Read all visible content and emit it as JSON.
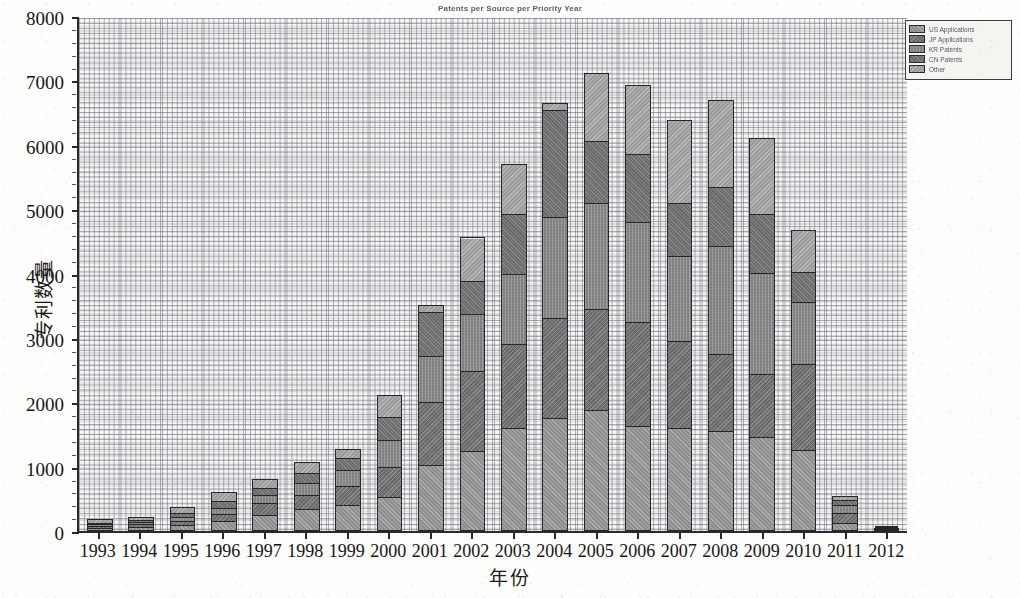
{
  "chart_data": {
    "type": "bar",
    "title": "Patents per Source per Priority Year",
    "xlabel": "年份",
    "ylabel": "专利数量",
    "ylim": [
      0,
      8000
    ],
    "ytick_step": 1000,
    "yticks": [
      "0",
      "1000",
      "2000",
      "3000",
      "4000",
      "5000",
      "6000",
      "7000",
      "8000"
    ],
    "grid": true,
    "grid_style": "dashed",
    "minor_ticks": true,
    "stacked": true,
    "legend_position": "top-right",
    "categories": [
      "1993",
      "1994",
      "1995",
      "1996",
      "1997",
      "1998",
      "1999",
      "2000",
      "2001",
      "2002",
      "2003",
      "2004",
      "2005",
      "2006",
      "2007",
      "2008",
      "2009",
      "2010",
      "2011",
      "2012"
    ],
    "series": [
      {
        "name": "US Applications",
        "values": [
          40,
          55,
          90,
          150,
          250,
          330,
          400,
          520,
          1020,
          1230,
          1590,
          1750,
          1880,
          1620,
          1600,
          1550,
          1450,
          1250,
          110,
          20
        ]
      },
      {
        "name": "JP Applications",
        "values": [
          35,
          45,
          70,
          110,
          180,
          230,
          300,
          480,
          980,
          1260,
          1310,
          1560,
          1570,
          1620,
          1350,
          1200,
          980,
          1340,
          170,
          15
        ]
      },
      {
        "name": "KR Patents",
        "values": [
          30,
          40,
          60,
          100,
          130,
          190,
          260,
          420,
          720,
          890,
          1100,
          1570,
          1660,
          1560,
          1330,
          1680,
          1590,
          980,
          130,
          8
        ]
      },
      {
        "name": "CN Patents",
        "values": [
          35,
          40,
          75,
          110,
          120,
          160,
          180,
          370,
          700,
          510,
          940,
          1680,
          960,
          1060,
          830,
          930,
          910,
          460,
          90,
          5
        ]
      },
      {
        "name": "Other",
        "values": [
          45,
          45,
          85,
          140,
          130,
          160,
          140,
          320,
          90,
          670,
          760,
          90,
          1050,
          1070,
          1280,
          1340,
          1170,
          650,
          40,
          2
        ]
      }
    ],
    "totals": [
      185,
      225,
      380,
      610,
      810,
      1070,
      1280,
      2110,
      3510,
      4560,
      5700,
      6650,
      7120,
      6930,
      6390,
      6700,
      6100,
      4680,
      540,
      50
    ]
  },
  "legend": {
    "items": [
      {
        "label": "US Applications",
        "color": "#8e8e8e"
      },
      {
        "label": "JP Applications",
        "color": "#6f6f6f"
      },
      {
        "label": "KR Patents",
        "color": "#858585"
      },
      {
        "label": "CN Patents",
        "color": "#6a6a6a"
      },
      {
        "label": "Other",
        "color": "#9b9b9b"
      }
    ]
  }
}
